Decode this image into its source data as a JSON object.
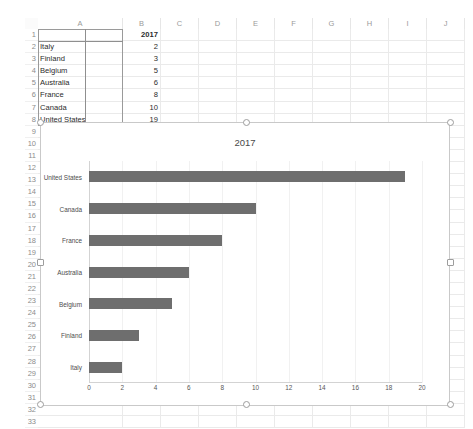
{
  "spreadsheet": {
    "columns": [
      "A",
      "B",
      "C",
      "D",
      "E",
      "F",
      "G",
      "H",
      "I",
      "J"
    ],
    "row_numbers": [
      "1",
      "2",
      "3",
      "4",
      "5",
      "6",
      "7",
      "8",
      "9",
      "10",
      "11",
      "12",
      "13",
      "14",
      "15",
      "16",
      "17",
      "18",
      "19",
      "20",
      "21",
      "22",
      "23",
      "24",
      "25",
      "26",
      "27",
      "28",
      "29",
      "30",
      "31",
      "32",
      "33"
    ],
    "rows": [
      {
        "row": "1",
        "a": "",
        "b": "2017"
      },
      {
        "row": "2",
        "a": "Italy",
        "b": "2"
      },
      {
        "row": "3",
        "a": "Finland",
        "b": "3"
      },
      {
        "row": "4",
        "a": "Belgium",
        "b": "5"
      },
      {
        "row": "5",
        "a": "Australia",
        "b": "6"
      },
      {
        "row": "6",
        "a": "France",
        "b": "8"
      },
      {
        "row": "7",
        "a": "Canada",
        "b": "10"
      },
      {
        "row": "8",
        "a": "United States",
        "b": "19"
      }
    ],
    "selected_range": "A1:B8"
  },
  "chart_data": {
    "type": "bar",
    "orientation": "horizontal",
    "title": "2017",
    "xlabel": "",
    "ylabel": "",
    "categories": [
      "United States",
      "Canada",
      "France",
      "Australia",
      "Belgium",
      "Finland",
      "Italy"
    ],
    "values": [
      19,
      10,
      8,
      6,
      5,
      3,
      2
    ],
    "series": [
      {
        "name": "2017",
        "values": [
          19,
          10,
          8,
          6,
          5,
          3,
          2
        ]
      }
    ],
    "xlim": [
      0,
      20
    ],
    "xticks": [
      0,
      2,
      4,
      6,
      8,
      10,
      12,
      14,
      16,
      18,
      20
    ],
    "xtick_labels": [
      "0",
      "2",
      "4",
      "6",
      "8",
      "10",
      "12",
      "14",
      "16",
      "18",
      "20"
    ],
    "grid": true,
    "grid_axis": "x",
    "legend": false,
    "bar_color": "#6e6e6e",
    "selected": true
  },
  "colors": {
    "bar": "#6e6e6e",
    "axis": "#d3d3d3",
    "gridline": "#f1f1f1",
    "chart_border": "#c9c9c9",
    "selection_border": "#9a9a9a"
  }
}
